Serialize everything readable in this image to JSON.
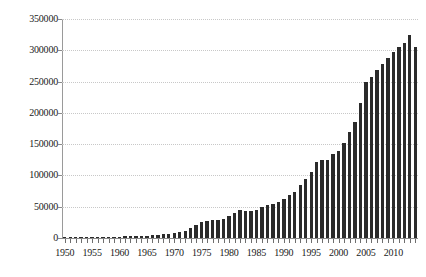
{
  "chart_data": {
    "type": "bar",
    "title": "",
    "subtitle": "",
    "xlabel": "",
    "ylabel": "",
    "xlim": [
      1949.5,
      2014.5
    ],
    "ylim": [
      0,
      350000
    ],
    "grid": true,
    "legend": null,
    "y_ticks": [
      0,
      50000,
      100000,
      150000,
      200000,
      250000,
      300000,
      350000
    ],
    "y_tick_labels": [
      "0",
      "50000",
      "100000",
      "150000",
      "200000",
      "250000",
      "300000",
      "350000"
    ],
    "x_tick_labels": [
      "1950",
      "1955",
      "1960",
      "1965",
      "1970",
      "1975",
      "1980",
      "1985",
      "1990",
      "1995",
      "2000",
      "2005",
      "2010"
    ],
    "x_tick_values": [
      1950,
      1955,
      1960,
      1965,
      1970,
      1975,
      1980,
      1985,
      1990,
      1995,
      2000,
      2005,
      2010
    ],
    "bar_color": "#2b2b2b",
    "categories": [
      1950,
      1951,
      1952,
      1953,
      1954,
      1955,
      1956,
      1957,
      1958,
      1959,
      1960,
      1961,
      1962,
      1963,
      1964,
      1965,
      1966,
      1967,
      1968,
      1969,
      1970,
      1971,
      1972,
      1973,
      1974,
      1975,
      1976,
      1977,
      1978,
      1979,
      1980,
      1981,
      1982,
      1983,
      1984,
      1985,
      1986,
      1987,
      1988,
      1989,
      1990,
      1991,
      1992,
      1993,
      1994,
      1995,
      1996,
      1997,
      1998,
      1999,
      2000,
      2001,
      2002,
      2003,
      2004,
      2005,
      2006,
      2007,
      2008,
      2009,
      2010,
      2011,
      2012,
      2013,
      2014
    ],
    "values": [
      500,
      600,
      700,
      800,
      900,
      1100,
      1300,
      1500,
      1700,
      1900,
      2200,
      2500,
      2800,
      3100,
      3500,
      4000,
      4600,
      5400,
      6300,
      7200,
      8600,
      10000,
      11500,
      16000,
      21000,
      26000,
      27000,
      28000,
      29000,
      31000,
      35000,
      40000,
      44000,
      43000,
      43000,
      45000,
      49000,
      52000,
      55000,
      58000,
      63000,
      68000,
      74000,
      84000,
      95000,
      106000,
      122000,
      124000,
      125000,
      134000,
      139000,
      152000,
      169000,
      186000,
      216000,
      249000,
      258000,
      268000,
      278000,
      288000,
      297000,
      305000,
      312000,
      324000,
      305000
    ]
  }
}
